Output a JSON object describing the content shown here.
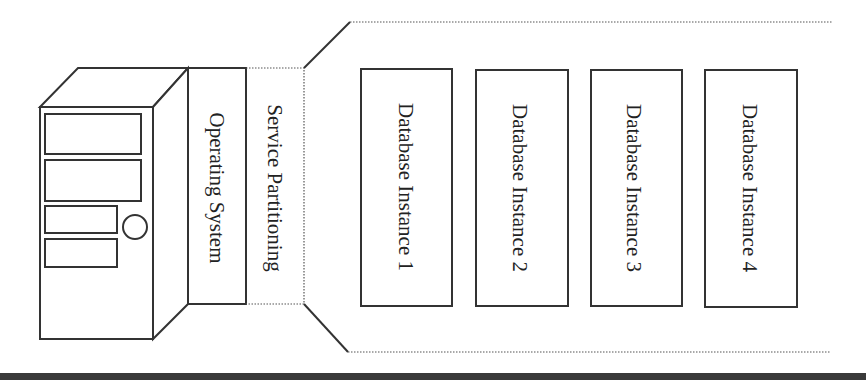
{
  "diagram": {
    "type": "architecture-stack",
    "server": {
      "icon": "server-tower-icon"
    },
    "layers": [
      {
        "id": "operating-system",
        "label": "Operating System",
        "border": "solid"
      },
      {
        "id": "service-partitioning",
        "label": "Service Partitioning",
        "border": "dotted"
      }
    ],
    "instances": [
      {
        "label": "Database Instance 1"
      },
      {
        "label": "Database Instance 2"
      },
      {
        "label": "Database Instance 3"
      },
      {
        "label": "Database Instance 4"
      }
    ],
    "colors": {
      "stroke": "#333333",
      "background": "#ffffff",
      "baseline_bar": "#3a3a3a"
    }
  }
}
